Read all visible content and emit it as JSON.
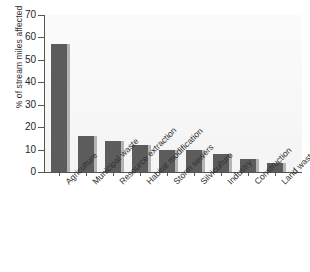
{
  "chart_data": {
    "type": "bar",
    "title": "",
    "subtitle": "",
    "xlabel": "",
    "ylabel": "% of stream miles affected",
    "ylim": [
      0,
      70
    ],
    "yticks": [
      0,
      10,
      20,
      30,
      40,
      50,
      60,
      70
    ],
    "ytick_labels": [
      "0",
      "10",
      "20",
      "30",
      "40",
      "50",
      "60",
      "70"
    ],
    "grid": false,
    "legend": null,
    "bar_color": "#5c5c5c",
    "plot_background": "#f7f7f7",
    "axis_color": "#555555",
    "categories": [
      "Agriculture",
      "Municipal waste",
      "Resource extraction",
      "Habitat modification",
      "Storm sewers",
      "Silviculture",
      "Industry",
      "Construction",
      "Land waste disposal"
    ],
    "values": [
      57,
      16,
      14,
      12,
      10,
      10,
      8,
      6,
      4
    ]
  }
}
